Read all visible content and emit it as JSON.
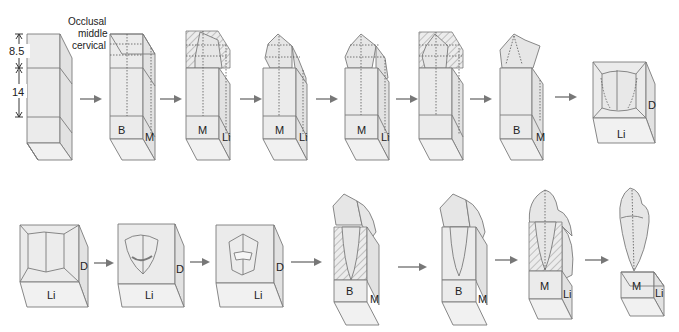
{
  "figure": {
    "dimension_labels": {
      "crown_height": "8.5",
      "root_height": "14"
    },
    "section_labels": [
      "Occlusal",
      "middle",
      "cervical"
    ],
    "colors": {
      "block_fill": "#ebebeb",
      "outline": "#7a7a7a",
      "arrow": "#777777",
      "text": "#222222"
    },
    "rows": [
      {
        "row": 1,
        "steps": [
          {
            "step": 1,
            "face_labels": []
          },
          {
            "step": 2,
            "face_labels": [
              "B",
              "M"
            ]
          },
          {
            "step": 3,
            "face_labels": [
              "M",
              "Li"
            ]
          },
          {
            "step": 4,
            "face_labels": [
              "M",
              "Li"
            ]
          },
          {
            "step": 5,
            "face_labels": [
              "M",
              "Li"
            ]
          },
          {
            "step": 6,
            "face_labels": []
          },
          {
            "step": 7,
            "face_labels": [
              "B",
              "M"
            ]
          },
          {
            "step": 8,
            "face_labels": [
              "Li",
              "D"
            ]
          }
        ]
      },
      {
        "row": 2,
        "steps": [
          {
            "step": 9,
            "face_labels": [
              "Li",
              "D"
            ]
          },
          {
            "step": 10,
            "face_labels": [
              "Li",
              "D"
            ]
          },
          {
            "step": 11,
            "face_labels": [
              "Li",
              "D"
            ]
          },
          {
            "step": 12,
            "face_labels": [
              "B",
              "M"
            ]
          },
          {
            "step": 13,
            "face_labels": [
              "B",
              "M"
            ]
          },
          {
            "step": 14,
            "face_labels": [
              "M",
              "Li"
            ]
          },
          {
            "step": 15,
            "face_labels": [
              "M",
              "Li"
            ]
          }
        ]
      }
    ],
    "labels": {
      "B": "B",
      "M": "M",
      "Li": "Li",
      "D": "D"
    }
  }
}
